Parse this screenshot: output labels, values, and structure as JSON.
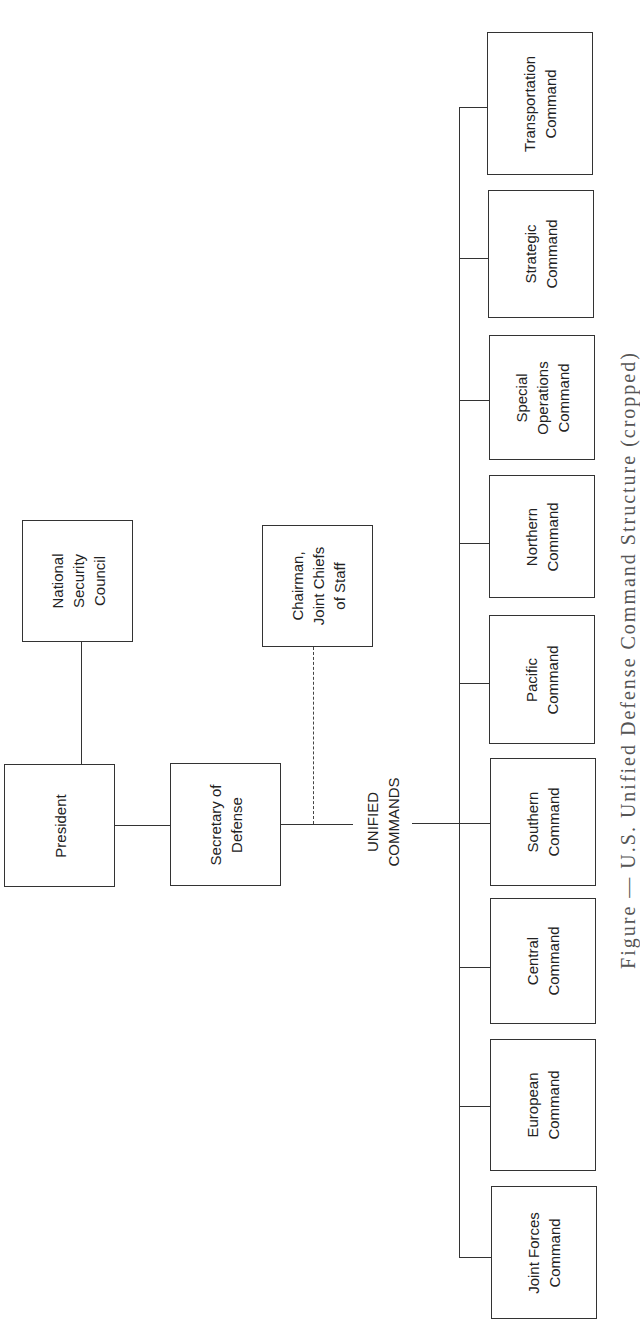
{
  "chart": {
    "nodes": {
      "president": "President",
      "nsc": "National\nSecurity\nCouncil",
      "secdef": "Secretary of\nDefense",
      "cjcs": "Chairman,\nJoint Chiefs\nof Staff",
      "unified": "UNIFIED\nCOMMANDS"
    },
    "commands": [
      "Transportation\nCommand",
      "Strategic\nCommand",
      "Special\nOperations\nCommand",
      "Northern\nCommand",
      "Pacific\nCommand",
      "Southern\nCommand",
      "Central\nCommand",
      "European\nCommand",
      "Joint Forces\nCommand"
    ],
    "caption": "Figure — U.S. Unified Defense Command Structure (cropped)"
  },
  "colors": {
    "line": "#333333",
    "background": "#ffffff"
  }
}
